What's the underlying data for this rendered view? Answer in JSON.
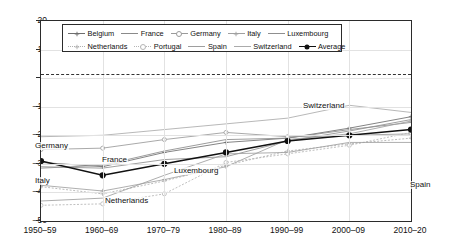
{
  "chart_data": {
    "type": "line",
    "title": "",
    "subtitle": "",
    "xlabel": "",
    "ylabel": "",
    "categories": [
      "1950–59",
      "1960–69",
      "1970–79",
      "1980–89",
      "1990–99",
      "2000–09",
      "2010–20"
    ],
    "ylim": [
      -50,
      20
    ],
    "yticks": [
      20,
      10,
      0,
      -10,
      -20,
      -30,
      -40,
      -50
    ],
    "ytick_labels": [
      "20",
      "10",
      "0",
      "−10",
      "−20",
      "−30",
      "−40",
      "−50"
    ],
    "grid": true,
    "zero_reference_line": 1.5,
    "legend_position": "top-inside",
    "series": [
      {
        "name": "Belgium",
        "marker": "plus",
        "dash": "solid",
        "color": "#6e6e6e",
        "values": [
          -29.5,
          -31.0,
          -26.0,
          -22.5,
          -21.0,
          -17.5,
          -13.5
        ]
      },
      {
        "name": "France",
        "marker": "none",
        "dash": "solid",
        "color": "#8a8a8a",
        "values": [
          -31.5,
          -30.5,
          -25.5,
          -21.5,
          -21.0,
          -18.0,
          -15.5
        ]
      },
      {
        "name": "Germany",
        "marker": "open-circle",
        "dash": "solid",
        "color": "#9a9a9a",
        "values": [
          -25.0,
          -24.5,
          -21.5,
          -19.0,
          -20.5,
          -20.0,
          -19.5
        ]
      },
      {
        "name": "Italy",
        "marker": "plus",
        "dash": "solid",
        "color": "#a0a0a0",
        "values": [
          -37.5,
          -39.5,
          -35.5,
          -31.0,
          -21.5,
          -19.5,
          -15.0
        ]
      },
      {
        "name": "Luxembourg",
        "marker": "none",
        "dash": "solid",
        "color": "#8f8f8f",
        "values": [
          -31.0,
          -31.5,
          -28.5,
          -27.5,
          -22.0,
          -18.5,
          -14.5
        ]
      },
      {
        "name": "Netherlands",
        "marker": "plus",
        "dash": "dotted",
        "color": "#b0b0b0",
        "values": [
          -38.0,
          -40.5,
          -36.0,
          -30.5,
          -25.5,
          -23.0,
          -21.0
        ]
      },
      {
        "name": "Portugal",
        "marker": "open-circle",
        "dash": "dotted",
        "color": "#b5b5b5",
        "values": [
          -44.5,
          -44.0,
          -40.5,
          -29.5,
          -26.5,
          -23.5,
          -19.0
        ]
      },
      {
        "name": "Spain",
        "marker": "none",
        "dash": "solid",
        "color": "#9e9e9e",
        "values": [
          -43.0,
          -42.0,
          -34.0,
          -26.5,
          -26.0,
          -22.5,
          -22.5
        ]
      },
      {
        "name": "Switzerland",
        "marker": "none",
        "dash": "solid",
        "color": "#ababab",
        "values": [
          -20.5,
          -20.0,
          -18.0,
          -16.0,
          -14.0,
          -9.5,
          -12.0
        ]
      },
      {
        "name": "Average",
        "marker": "filled-circle",
        "dash": "solid",
        "color": "#111111",
        "values": [
          -29.0,
          -34.0,
          -30.0,
          -26.0,
          -22.0,
          -20.0,
          -18.0
        ]
      }
    ],
    "annotations": [
      {
        "text": "Germany",
        "x_px": 33,
        "y_px": 141
      },
      {
        "text": "France",
        "x_px": 100,
        "y_px": 155
      },
      {
        "text": "Italy",
        "x_px": 33,
        "y_px": 176
      },
      {
        "text": "Luxembourg",
        "x_px": 172,
        "y_px": 166
      },
      {
        "text": "Netherlands",
        "x_px": 103,
        "y_px": 196
      },
      {
        "text": "Switzerland",
        "x_px": 301,
        "y_px": 101
      },
      {
        "text": "Spain",
        "x_px": 408,
        "y_px": 180
      }
    ]
  },
  "legend": {
    "rows": [
      [
        "Belgium",
        "France",
        "Germany",
        "Italy",
        "Luxembourg"
      ],
      [
        "Netherlands",
        "Portugal",
        "Spain",
        "Switzerland",
        "Average"
      ]
    ]
  }
}
